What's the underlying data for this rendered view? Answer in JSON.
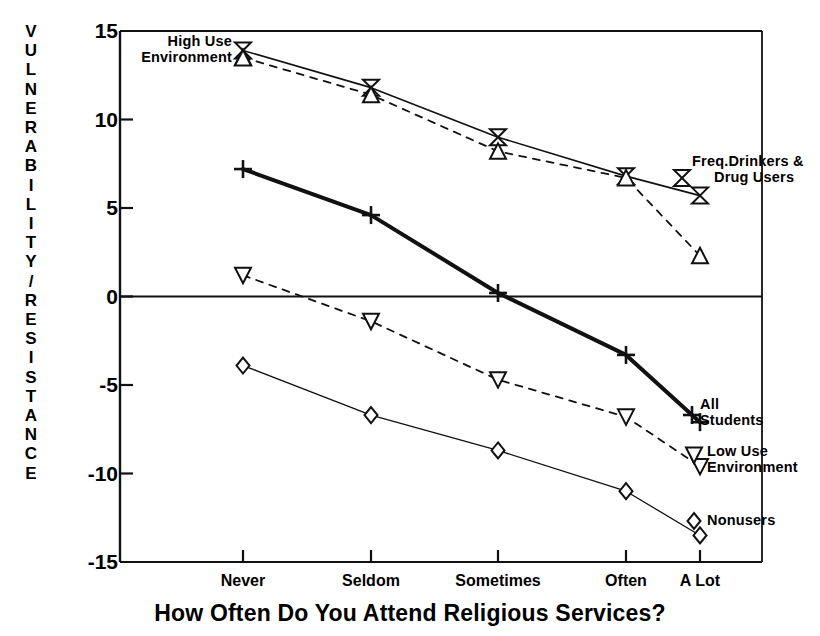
{
  "chart_data": {
    "type": "line",
    "title": "",
    "xlabel": "How Often Do You Attend Religious Services?",
    "ylabel": "VULNERABILITY/RESISTANCE",
    "categories": [
      "Never",
      "Seldom",
      "Sometimes",
      "Often",
      "A Lot"
    ],
    "ylim": [
      -15,
      15
    ],
    "yticks": [
      15,
      10,
      5,
      0,
      -5,
      -10,
      -15
    ],
    "grid": false,
    "legend_position": "inline-annotations",
    "zero_line": true,
    "series": [
      {
        "name": "Freq.Drinkers & Drug Users",
        "marker": "bowtie",
        "linestyle": "solid",
        "linewidth": 1.6,
        "values": [
          13.9,
          11.8,
          9.0,
          6.8,
          5.7
        ]
      },
      {
        "name": "High Use Environment",
        "marker": "triangle-up",
        "linestyle": "dashed",
        "linewidth": 1.8,
        "values": [
          13.5,
          11.4,
          8.2,
          6.7,
          2.3
        ]
      },
      {
        "name": "All Students",
        "marker": "plus",
        "linestyle": "solid",
        "linewidth": 4.0,
        "values": [
          7.2,
          4.6,
          0.2,
          -3.3,
          -7.1
        ]
      },
      {
        "name": "Low Use Environment",
        "marker": "triangle-down",
        "linestyle": "dashed",
        "linewidth": 1.8,
        "values": [
          1.2,
          -1.4,
          -4.7,
          -6.8,
          -9.6
        ]
      },
      {
        "name": "Nonusers",
        "marker": "diamond",
        "linestyle": "solid",
        "linewidth": 1.3,
        "values": [
          -3.9,
          -6.7,
          -8.7,
          -11.0,
          -13.5
        ]
      }
    ]
  },
  "axis": {
    "y_caption_letters": [
      "V",
      "U",
      "L",
      "N",
      "E",
      "R",
      "A",
      "B",
      "I",
      "L",
      "I",
      "T",
      "Y",
      "/",
      "R",
      "E",
      "S",
      "I",
      "S",
      "T",
      "A",
      "N",
      "C",
      "E"
    ],
    "y_caption": "VULNERABILITY/RESISTANCE",
    "y_tick_labels": [
      "15",
      "10",
      "5",
      "0",
      "-5",
      "-10",
      "-15"
    ],
    "x_tick_labels": [
      "Never",
      "Seldom",
      "Sometimes",
      "Often",
      "A Lot"
    ],
    "x_axis_title": "How Often Do You Attend Religious Services?"
  },
  "annotations": {
    "high_use": {
      "line1": "High Use",
      "line2": "Environment"
    },
    "freq_drinkers": {
      "line1": "Freq.Drinkers &",
      "line2": "Drug Users"
    },
    "all_students": {
      "line1": "All",
      "line2": "Students"
    },
    "low_use": {
      "line1": "Low Use",
      "line2": "Environment"
    },
    "nonusers": {
      "line1": "Nonusers"
    }
  },
  "colors": {
    "ink": "#111111",
    "background": "#ffffff"
  }
}
